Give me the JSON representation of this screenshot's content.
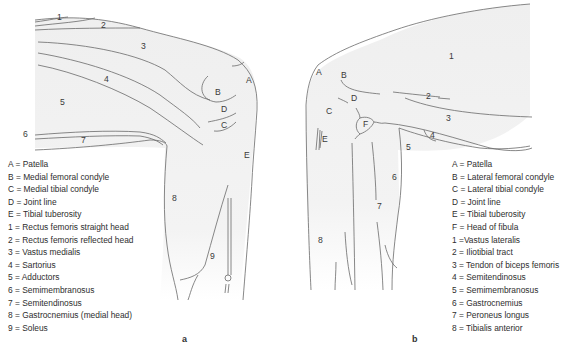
{
  "panels": [
    {
      "id": "a",
      "panel_label": "a",
      "view": "medial knee",
      "markers": {
        "A": "A",
        "B": "B",
        "C": "C",
        "D": "D",
        "E": "E",
        "n1": "1",
        "n2": "2",
        "n3": "3",
        "n4": "4",
        "n5": "5",
        "n6": "6",
        "n7": "7",
        "n8": "8",
        "n9": "9"
      },
      "legend": [
        "A = Patella",
        "B = Medial femoral condyle",
        "C = Medial tibial condyle",
        "D = Joint line",
        "E = Tibial tuberosity",
        "1 = Rectus femoris straight head",
        "2 = Rectus femoris reflected head",
        "3 = Vastus medialis",
        "4 = Sartorius",
        "5 = Adductors",
        "6 = Semimembranosus",
        "7 = Semitendinosus",
        "8 = Gastrocnemius (medial head)",
        "9 = Soleus"
      ]
    },
    {
      "id": "b",
      "panel_label": "b",
      "view": "lateral knee",
      "markers": {
        "A": "A",
        "B": "B",
        "C": "C",
        "D": "D",
        "E": "E",
        "F": "F",
        "n1": "1",
        "n2": "2",
        "n3": "3",
        "n4": "4",
        "n5": "5",
        "n6": "6",
        "n7": "7",
        "n8": "8"
      },
      "legend": [
        "A = Patella",
        "B = Lateral femoral condyle",
        "C = Lateral tibial condyle",
        "D = Joint line",
        "E = Tibial tuberosity",
        "F = Head of fibula",
        "1 =Vastus lateralis",
        "2 = Iliotibial tract",
        "3 = Tendon of biceps femoris",
        "4 = Semitendinosus",
        "5 = Semimembranosus",
        "6 = Gastrocnemius",
        "7 = Peroneus longus",
        "8 =  Tibialis anterior"
      ]
    }
  ],
  "colors": {
    "limb_fill": "#f1f1f1",
    "outline": "#6a6a6a",
    "text": "#333333"
  }
}
